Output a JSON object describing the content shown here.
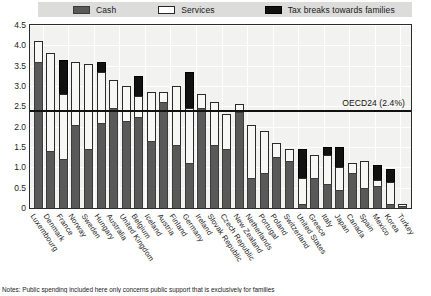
{
  "legend": {
    "items": [
      {
        "label": "Cash",
        "icon": "cash-swatch",
        "color": "#595959"
      },
      {
        "label": "Services",
        "icon": "services-swatch",
        "color": "#ffffff"
      },
      {
        "label": "Tax breaks towards families",
        "icon": "tax-swatch",
        "color": "#111111"
      }
    ]
  },
  "reference": {
    "label": "OECD24 (2.4%)",
    "value": 2.4
  },
  "note": "Notes: Public spending included here only concerns public support that is exclusively for families",
  "chart_data": {
    "type": "bar",
    "title": "",
    "xlabel": "",
    "ylabel": "",
    "ylim": [
      0,
      4.5
    ],
    "yticks": [
      "0",
      "0.5",
      "1.0",
      "1.5",
      "2.0",
      "2.5",
      "3.0",
      "3.5",
      "4.0",
      "4.5"
    ],
    "ytick_values": [
      0,
      0.5,
      1.0,
      1.5,
      2.0,
      2.5,
      3.0,
      3.5,
      4.0,
      4.5
    ],
    "grid": true,
    "stacked": true,
    "legend_position": "top",
    "categories": [
      "Luxembourg",
      "Denmark",
      "France",
      "Norway",
      "Sweden",
      "Hungary",
      "Australia",
      "United Kingdom",
      "Belgium",
      "Iceland",
      "Austria",
      "Finland",
      "Germany",
      "Ireland",
      "Slovak Republic",
      "Czech Republic",
      "New Zealand",
      "Netherlands",
      "Portugal",
      "Poland",
      "Switzerland",
      "United States",
      "Greece",
      "Italy",
      "Japan",
      "Canada",
      "Spain",
      "Mexico",
      "Korea",
      "Turkey"
    ],
    "series": [
      {
        "name": "Cash",
        "color": "#595959",
        "values": [
          3.6,
          1.4,
          1.2,
          2.05,
          1.45,
          2.1,
          2.45,
          2.15,
          2.25,
          1.65,
          2.6,
          1.55,
          1.1,
          2.45,
          1.55,
          1.45,
          2.35,
          0.75,
          0.85,
          1.25,
          1.15,
          0.1,
          0.75,
          0.6,
          0.45,
          0.85,
          0.5,
          0.55,
          0.1,
          0.05
        ]
      },
      {
        "name": "Services",
        "color": "#f7f7f5",
        "values": [
          0.5,
          2.4,
          1.6,
          1.55,
          2.1,
          1.25,
          0.7,
          0.85,
          0.5,
          1.2,
          0.25,
          1.45,
          1.35,
          0.35,
          1.05,
          0.85,
          0.2,
          1.3,
          1.05,
          0.35,
          0.3,
          0.65,
          0.55,
          0.7,
          0.55,
          0.25,
          0.65,
          0.15,
          0.55,
          0.05
        ]
      },
      {
        "name": "Tax breaks towards families",
        "color": "#111111",
        "values": [
          0.0,
          0.0,
          0.85,
          0.0,
          0.0,
          0.25,
          0.0,
          0.0,
          0.5,
          0.0,
          0.0,
          0.0,
          0.9,
          0.0,
          0.0,
          0.0,
          0.0,
          0.0,
          0.0,
          0.0,
          0.0,
          0.7,
          0.0,
          0.2,
          0.5,
          0.0,
          0.0,
          0.35,
          0.3,
          0.0
        ]
      }
    ]
  }
}
